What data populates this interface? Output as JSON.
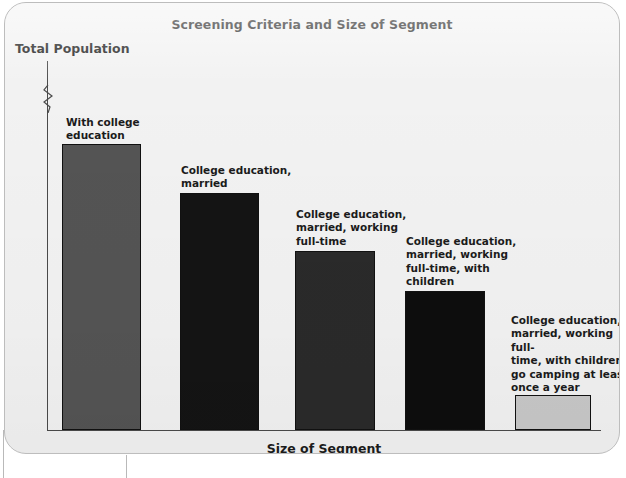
{
  "chart_data": {
    "type": "bar",
    "title": "Screening Criteria and Size of Segment",
    "xlabel": "Size of Segment",
    "ylabel": "Total Population",
    "grid": false,
    "legend": "none",
    "axis_break": true,
    "ylim": [
      0,
      100
    ],
    "categories": [
      "With college education",
      "College education, married",
      "College education, married, working full-time",
      "College education, married, working full-time, with children",
      "College education, married, working full-time, with children, go camping at least once a year"
    ],
    "values": [
      78,
      64,
      48,
      37,
      9
    ],
    "colors": [
      "#545454",
      "#141414",
      "#2a2a2a",
      "#0d0d0d",
      "#c8c8c8"
    ]
  },
  "chart": {
    "title": "Screening Criteria and Size of Segment",
    "y_axis_label": "Total Population",
    "x_axis_label": "Size of Segment",
    "bars": [
      {
        "caption": "With college\neducation",
        "caption_lines": [
          "With college",
          "education"
        ],
        "value": 78,
        "color": "#545454",
        "left": 57,
        "width": 79,
        "top": 141,
        "caption_left": 61,
        "caption_top": 113,
        "caption_width": 120
      },
      {
        "caption": "College education,\nmarried",
        "caption_lines": [
          "College education,",
          "married"
        ],
        "value": 64,
        "color": "#141414",
        "left": 175,
        "width": 79,
        "top": 190,
        "caption_left": 176,
        "caption_top": 161,
        "caption_width": 130
      },
      {
        "caption": "College education,\nmarried, working\nfull-time",
        "caption_lines": [
          "College education,",
          "married, working",
          "full-time"
        ],
        "value": 48,
        "color": "#2a2a2a",
        "left": 290,
        "width": 80,
        "top": 248,
        "caption_left": 291,
        "caption_top": 205,
        "caption_width": 130
      },
      {
        "caption": "College education,\nmarried, working\nfull-time, with\nchildren",
        "caption_lines": [
          "College education,",
          "married, working",
          "full-time, with",
          "children"
        ],
        "value": 37,
        "color": "#0d0d0d",
        "left": 400,
        "width": 80,
        "top": 288,
        "caption_left": 401,
        "caption_top": 232,
        "caption_width": 130
      },
      {
        "caption": "College education,\nmarried, working full-\ntime, with children,\ngo camping at least\nonce a year",
        "caption_lines": [
          "College education,",
          "married, working full-",
          "time, with children,",
          "go camping at least",
          "once a year"
        ],
        "value": 9,
        "color": "#c8c8c8",
        "left": 510,
        "width": 76,
        "top": 392,
        "caption_left": 506,
        "caption_top": 311,
        "caption_width": 120
      }
    ]
  }
}
